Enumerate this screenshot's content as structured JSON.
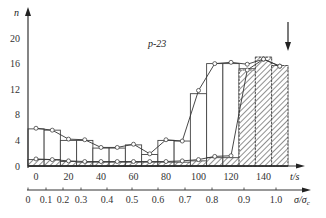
{
  "chart_data": {
    "type": "bar",
    "title": "",
    "annotation": "p-23",
    "ylabel": "n",
    "xlabel": "t/s",
    "x2label": "σ/σc",
    "ylim": [
      0,
      22
    ],
    "xlim": [
      -5,
      160
    ],
    "y_ticks": [
      0,
      4,
      8,
      12,
      16,
      20
    ],
    "x_ticks": [
      0,
      20,
      40,
      60,
      80,
      100,
      120,
      140
    ],
    "x2_ticks": [
      {
        "label": "0",
        "px": 28
      },
      {
        "label": "0.1",
        "px": 46
      },
      {
        "label": "0.2",
        "px": 63
      },
      {
        "label": "0.3",
        "px": 81
      },
      {
        "label": "0.4",
        "px": 107
      },
      {
        "label": "0.5",
        "px": 132
      },
      {
        "label": "0.6",
        "px": 158
      },
      {
        "label": "0.7",
        "px": 185
      },
      {
        "label": "0.8",
        "px": 212
      },
      {
        "label": "0.9",
        "px": 244
      },
      {
        "label": "1.0",
        "px": 276
      }
    ],
    "bin_edges": [
      -5,
      5,
      15,
      25,
      35,
      45,
      55,
      65,
      75,
      85,
      95,
      105,
      115,
      125,
      135,
      145,
      155
    ],
    "series": [
      {
        "name": "total (open bars)",
        "values": [
          5.8,
          5.6,
          4.0,
          4.0,
          2.8,
          2.8,
          3.3,
          1.8,
          4.0,
          3.9,
          11.3,
          16.0,
          16.0,
          15.2,
          17.0,
          15.7
        ]
      },
      {
        "name": "hatched bars",
        "values": [
          1.0,
          1.0,
          0.7,
          0.6,
          0.6,
          0.6,
          0.6,
          0.6,
          0.6,
          0.6,
          0.8,
          1.3,
          1.3,
          15.0,
          17.0,
          15.7
        ]
      },
      {
        "name": "upper line (circles)",
        "type": "line",
        "x": [
          0,
          10,
          20,
          30,
          40,
          50,
          60,
          70,
          80,
          90,
          100,
          110,
          120,
          130,
          140,
          150
        ],
        "values": [
          5.9,
          5.6,
          4.2,
          4.1,
          2.9,
          2.9,
          3.4,
          1.9,
          4.1,
          3.9,
          11.8,
          16.0,
          16.2,
          15.9,
          16.7,
          15.6
        ]
      },
      {
        "name": "lower line (circles)",
        "type": "line",
        "x": [
          0,
          10,
          20,
          30,
          40,
          50,
          60,
          70,
          80,
          90,
          100,
          110,
          120,
          130,
          140,
          150
        ],
        "values": [
          1.1,
          1.0,
          0.8,
          0.7,
          0.7,
          0.7,
          0.7,
          0.7,
          0.7,
          0.8,
          1.0,
          1.5,
          1.6,
          15.0,
          16.7,
          15.6
        ]
      }
    ],
    "marker_arrow": {
      "x": 152,
      "from_y": 23,
      "to_y": 18
    },
    "grid": false,
    "legend": "none"
  },
  "labels": {
    "y_axis": "n",
    "x_axis": "t/s",
    "x2_axis_main": "σ/σ",
    "x2_axis_sub": "c",
    "annotation": "p-23"
  }
}
